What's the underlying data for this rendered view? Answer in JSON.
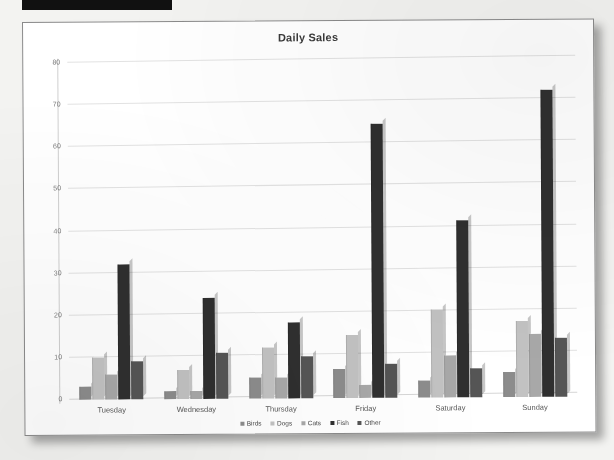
{
  "document": {
    "redaction_bar": "redacted-header-block",
    "page_background": "#f3f3f1",
    "card_background": "#ffffff"
  },
  "chart_data": {
    "type": "bar",
    "title": "Daily Sales",
    "xlabel": "",
    "ylabel": "",
    "ylim": [
      0,
      80
    ],
    "yticks": [
      0,
      10,
      20,
      30,
      40,
      50,
      60,
      70,
      80
    ],
    "grid": true,
    "legend_position": "bottom",
    "categories": [
      "Tuesday",
      "Wednesday",
      "Thursday",
      "Friday",
      "Saturday",
      "Sunday"
    ],
    "series": [
      {
        "name": "Birds",
        "color": "#8c8c8c",
        "values": [
          3,
          2,
          5,
          7,
          4,
          6
        ]
      },
      {
        "name": "Dogs",
        "color": "#c2c2c2",
        "values": [
          10,
          7,
          12,
          15,
          21,
          18
        ]
      },
      {
        "name": "Cats",
        "color": "#a8a8a8",
        "values": [
          6,
          2,
          5,
          3,
          10,
          15
        ]
      },
      {
        "name": "Fish",
        "color": "#2f2f2f",
        "values": [
          32,
          24,
          18,
          65,
          42,
          73
        ]
      },
      {
        "name": "Other",
        "color": "#555555",
        "values": [
          9,
          11,
          10,
          8,
          7,
          14
        ]
      }
    ]
  }
}
